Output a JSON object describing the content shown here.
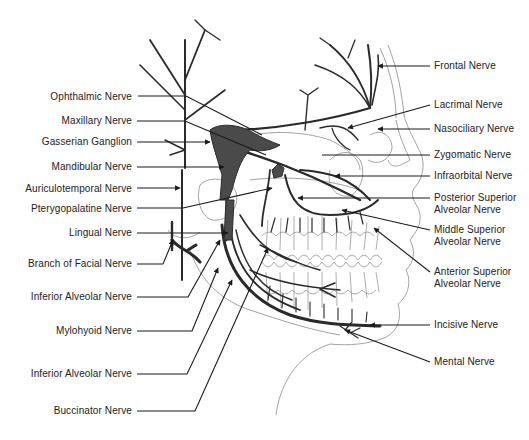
{
  "diagram": {
    "left_labels": [
      {
        "id": "ophthalmic",
        "text": "Ophthalmic Nerve",
        "x": 132,
        "y": 91
      },
      {
        "id": "maxillary",
        "text": "Maxillary Nerve",
        "x": 132,
        "y": 115
      },
      {
        "id": "gasserian",
        "text": "Gasserian Ganglion",
        "x": 132,
        "y": 136
      },
      {
        "id": "mandibular",
        "text": "Mandibular Nerve",
        "x": 132,
        "y": 161
      },
      {
        "id": "auriculotemporal",
        "text": "Auriculotemporal Nerve",
        "x": 132,
        "y": 183
      },
      {
        "id": "pterygopalatine",
        "text": "Pterygopalatine Nerve",
        "x": 132,
        "y": 203
      },
      {
        "id": "lingual",
        "text": "Lingual Nerve",
        "x": 132,
        "y": 227
      },
      {
        "id": "facial-branch",
        "text": "Branch of Facial Nerve",
        "x": 132,
        "y": 258
      },
      {
        "id": "inferior-alveolar-1",
        "text": "Inferior Alveolar Nerve",
        "x": 132,
        "y": 291
      },
      {
        "id": "mylohyoid",
        "text": "Mylohyoid Nerve",
        "x": 132,
        "y": 325
      },
      {
        "id": "inferior-alveolar-2",
        "text": "Inferior Alveolar Nerve",
        "x": 132,
        "y": 368
      },
      {
        "id": "buccinator",
        "text": "Buccinator Nerve",
        "x": 132,
        "y": 405
      }
    ],
    "right_labels": [
      {
        "id": "frontal",
        "text": "Frontal Nerve",
        "x": 434,
        "y": 61
      },
      {
        "id": "lacrimal",
        "text": "Lacrimal Nerve",
        "x": 434,
        "y": 101
      },
      {
        "id": "nasociliary",
        "text": "Nasociliary Nerve",
        "x": 434,
        "y": 123
      },
      {
        "id": "zygomatic",
        "text": "Zygomatic Nerve",
        "x": 434,
        "y": 149
      },
      {
        "id": "infraorbital",
        "text": "Infraorbital Nerve",
        "x": 434,
        "y": 170
      },
      {
        "id": "posterior-superior-alveolar",
        "text": "Posterior Superior\nAlveolar Nerve",
        "line1": "Posterior Superior",
        "line2": "Alveolar Nerve",
        "x": 434,
        "y": 190
      },
      {
        "id": "middle-superior-alveolar",
        "text": "Middle Superior\nAlveolar Nerve",
        "line1": "Middle Superior",
        "line2": "Alveolar Nerve",
        "x": 434,
        "y": 222
      },
      {
        "id": "anterior-superior-alveolar",
        "text": "Anterior Superior\nAlveolar Nerve",
        "line1": "Anterior Superior",
        "line2": "Alveolar Nerve",
        "x": 434,
        "y": 264
      },
      {
        "id": "incisive",
        "text": "Incisive Nerve",
        "x": 434,
        "y": 319
      },
      {
        "id": "mental",
        "text": "Mental Nerve",
        "x": 434,
        "y": 355
      }
    ],
    "colors": {
      "nerve": "#2a2a2a",
      "ganglion": "#4a4a4a",
      "outline": "#888888",
      "leader": "#1a1a1a",
      "text": "#222222"
    }
  }
}
